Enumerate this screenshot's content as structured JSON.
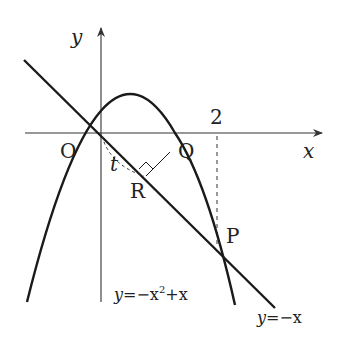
{
  "diagram": {
    "labels": {
      "y_axis": "y",
      "x_axis": "x",
      "origin": "O",
      "tick_2": "2",
      "point_P": "P",
      "point_Q": "Q",
      "point_R": "R",
      "segment_t": "t",
      "parabola_eq_lhs": "y",
      "parabola_eq_mid": "=−x",
      "parabola_eq_exp": "2",
      "parabola_eq_rhs": "+x",
      "line_eq_lhs": "y",
      "line_eq_rhs": "=−x"
    },
    "curves": [
      {
        "name": "parabola",
        "equation": "y = -x^2 + x"
      },
      {
        "name": "line",
        "equation": "y = -x"
      }
    ],
    "points": {
      "O": [
        0,
        0
      ],
      "P": [
        2,
        -2
      ]
    },
    "colors": {
      "stroke": "#1a1a1a",
      "axis": "#333333",
      "text": "#222222"
    }
  }
}
